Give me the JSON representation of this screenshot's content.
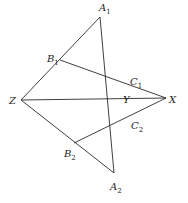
{
  "diagram": {
    "type": "geometry-figure",
    "points": {
      "A1": {
        "x": 100,
        "y": 17,
        "label": "A",
        "sub": "1",
        "lx": 99,
        "ly": 11
      },
      "B1": {
        "x": 60,
        "y": 60,
        "label": "B",
        "sub": "1",
        "lx": 47,
        "ly": 62
      },
      "C1": {
        "x": 128,
        "y": 80,
        "label": "C",
        "sub": "1",
        "lx": 130,
        "ly": 85
      },
      "A2": {
        "x": 114,
        "y": 173,
        "label": "A",
        "sub": "2",
        "lx": 110,
        "ly": 190
      },
      "B2": {
        "x": 74,
        "y": 143,
        "label": "B",
        "sub": "2",
        "lx": 64,
        "ly": 157
      },
      "C2": {
        "x": 129,
        "y": 118,
        "label": "C",
        "sub": "2",
        "lx": 131,
        "ly": 129
      },
      "Z": {
        "x": 21,
        "y": 100,
        "label": "Z",
        "sub": "",
        "lx": 9,
        "ly": 104
      },
      "Y": {
        "x": 132,
        "y": 99,
        "label": "Y",
        "sub": "",
        "lx": 123,
        "ly": 103
      },
      "X": {
        "x": 166,
        "y": 98,
        "label": "X",
        "sub": "",
        "lx": 169,
        "ly": 103
      }
    },
    "segments": [
      [
        "Z",
        "A1"
      ],
      [
        "A1",
        "A2"
      ],
      [
        "B1",
        "X"
      ],
      [
        "Z",
        "X"
      ],
      [
        "Z",
        "A2"
      ],
      [
        "B2",
        "X"
      ]
    ]
  }
}
